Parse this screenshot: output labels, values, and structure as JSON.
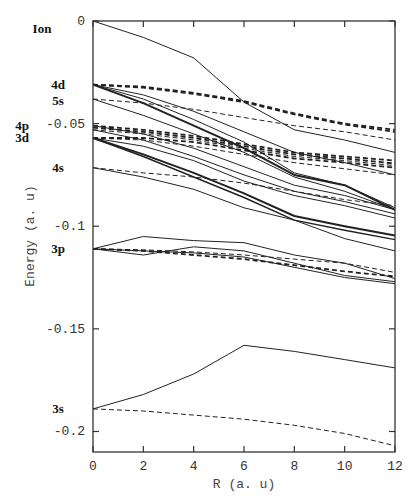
{
  "chart_data": {
    "type": "line",
    "title": "",
    "xlabel": "R (a. u)",
    "ylabel": "Energy (a. u)",
    "xlim": [
      0,
      12
    ],
    "ylim": [
      -0.21,
      0
    ],
    "grid": false,
    "legend": "none",
    "x_ticks": [
      0,
      2,
      4,
      6,
      8,
      10,
      12
    ],
    "x_tick_labels": [
      "0",
      "2",
      "4",
      "6",
      "8",
      "10",
      "12"
    ],
    "y_ticks": [
      0,
      -0.05,
      -0.1,
      -0.15,
      -0.2
    ],
    "y_tick_labels": [
      "0",
      "-0.05",
      "-0.1",
      "-0.15",
      "-0.2"
    ],
    "state_labels": [
      {
        "text": "Ion",
        "energy": -0.004
      },
      {
        "text": "4d",
        "energy": -0.031
      },
      {
        "text": "5s",
        "energy": -0.039
      },
      {
        "text": "4p",
        "energy": -0.051
      },
      {
        "text": "3d",
        "energy": -0.057
      },
      {
        "text": "4s",
        "energy": -0.0715
      },
      {
        "text": "3p",
        "energy": -0.111
      },
      {
        "text": "3s",
        "energy": -0.189
      }
    ],
    "x": [
      0,
      2,
      4,
      6,
      8,
      10,
      12
    ],
    "series": [
      {
        "name": "Ion",
        "style": "solid",
        "width": 1,
        "values": [
          0,
          -0.008,
          -0.018,
          -0.0395,
          -0.053,
          -0.058,
          -0.064
        ]
      },
      {
        "name": "4d-a dashed",
        "style": "dashed",
        "width": 1.8,
        "values": [
          -0.031,
          -0.032,
          -0.035,
          -0.039,
          -0.045,
          -0.05,
          -0.053
        ]
      },
      {
        "name": "4d-b dashed",
        "style": "dashed",
        "width": 1.8,
        "values": [
          -0.031,
          -0.0325,
          -0.0355,
          -0.0395,
          -0.0455,
          -0.0505,
          -0.054
        ]
      },
      {
        "name": "5s dashed",
        "style": "dashed",
        "width": 1,
        "values": [
          -0.038,
          -0.04,
          -0.043,
          -0.047,
          -0.051,
          -0.054,
          -0.058
        ]
      },
      {
        "name": "4d solid a",
        "style": "solid",
        "width": 2,
        "values": [
          -0.031,
          -0.04,
          -0.051,
          -0.062,
          -0.075,
          -0.08,
          -0.092
        ]
      },
      {
        "name": "4d solid b",
        "style": "solid",
        "width": 1,
        "values": [
          -0.031,
          -0.038,
          -0.048,
          -0.059,
          -0.074,
          -0.08,
          -0.091
        ]
      },
      {
        "name": "4d solid c",
        "style": "solid",
        "width": 1,
        "values": [
          -0.031,
          -0.036,
          -0.044,
          -0.054,
          -0.064,
          -0.069,
          -0.075
        ]
      },
      {
        "name": "5s solid",
        "style": "solid",
        "width": 1,
        "values": [
          -0.038,
          -0.046,
          -0.055,
          -0.064,
          -0.076,
          -0.083,
          -0.092
        ]
      },
      {
        "name": "4p dashed a",
        "style": "dashed",
        "width": 1.8,
        "values": [
          -0.051,
          -0.053,
          -0.056,
          -0.06,
          -0.064,
          -0.066,
          -0.068
        ]
      },
      {
        "name": "4p dashed b",
        "style": "dashed",
        "width": 1.8,
        "values": [
          -0.052,
          -0.054,
          -0.057,
          -0.061,
          -0.065,
          -0.067,
          -0.0695
        ]
      },
      {
        "name": "4p dashed c",
        "style": "dashed",
        "width": 1,
        "values": [
          -0.053,
          -0.055,
          -0.058,
          -0.062,
          -0.066,
          -0.068,
          -0.0705
        ]
      },
      {
        "name": "3d dashed a",
        "style": "dashed",
        "width": 1.8,
        "values": [
          -0.057,
          -0.057,
          -0.059,
          -0.063,
          -0.067,
          -0.069,
          -0.0715
        ]
      },
      {
        "name": "3d dashed b",
        "style": "dashed",
        "width": 1,
        "values": [
          -0.057,
          -0.058,
          -0.061,
          -0.065,
          -0.069,
          -0.072,
          -0.075
        ]
      },
      {
        "name": "4p solid a",
        "style": "solid",
        "width": 1,
        "values": [
          -0.051,
          -0.055,
          -0.062,
          -0.071,
          -0.08,
          -0.085,
          -0.092
        ]
      },
      {
        "name": "4p solid b",
        "style": "solid",
        "width": 1,
        "values": [
          -0.053,
          -0.058,
          -0.066,
          -0.075,
          -0.083,
          -0.088,
          -0.094
        ]
      },
      {
        "name": "3d solid a",
        "style": "solid",
        "width": 2,
        "values": [
          -0.057,
          -0.065,
          -0.074,
          -0.084,
          -0.095,
          -0.1,
          -0.1045
        ]
      },
      {
        "name": "3d solid b",
        "style": "solid",
        "width": 1.4,
        "values": [
          -0.057,
          -0.066,
          -0.076,
          -0.086,
          -0.097,
          -0.102,
          -0.1065
        ]
      },
      {
        "name": "3d solid c",
        "style": "solid",
        "width": 1,
        "values": [
          -0.057,
          -0.061,
          -0.068,
          -0.078,
          -0.085,
          -0.09,
          -0.096
        ]
      },
      {
        "name": "4s dashed",
        "style": "dashed",
        "width": 1,
        "values": [
          -0.0715,
          -0.074,
          -0.076,
          -0.079,
          -0.083,
          -0.087,
          -0.09
        ]
      },
      {
        "name": "4s solid",
        "style": "solid",
        "width": 1,
        "values": [
          -0.0715,
          -0.076,
          -0.082,
          -0.091,
          -0.097,
          -0.106,
          -0.112
        ]
      },
      {
        "name": "3p solid a",
        "style": "solid",
        "width": 1,
        "values": [
          -0.111,
          -0.105,
          -0.107,
          -0.108,
          -0.114,
          -0.118,
          -0.1255
        ]
      },
      {
        "name": "3p solid b",
        "style": "solid",
        "width": 1,
        "values": [
          -0.111,
          -0.114,
          -0.11,
          -0.112,
          -0.118,
          -0.124,
          -0.127
        ]
      },
      {
        "name": "3p solid c",
        "style": "solid",
        "width": 1,
        "values": [
          -0.111,
          -0.112,
          -0.113,
          -0.115,
          -0.12,
          -0.125,
          -0.128
        ]
      },
      {
        "name": "3p dashed a",
        "style": "dashed",
        "width": 1.8,
        "values": [
          -0.111,
          -0.112,
          -0.114,
          -0.116,
          -0.119,
          -0.122,
          -0.1245
        ]
      },
      {
        "name": "3p dashed b",
        "style": "dashed",
        "width": 1,
        "values": [
          -0.111,
          -0.1115,
          -0.1125,
          -0.114,
          -0.116,
          -0.118,
          -0.1225
        ]
      },
      {
        "name": "3s solid",
        "style": "solid",
        "width": 1,
        "values": [
          -0.189,
          -0.182,
          -0.172,
          -0.158,
          -0.161,
          -0.165,
          -0.169
        ]
      },
      {
        "name": "3s dashed",
        "style": "dashed",
        "width": 1,
        "values": [
          -0.189,
          -0.19,
          -0.192,
          -0.194,
          -0.197,
          -0.201,
          -0.207
        ]
      }
    ]
  }
}
